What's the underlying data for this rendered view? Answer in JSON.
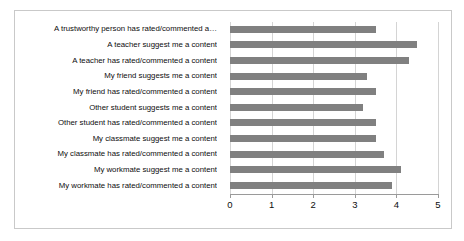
{
  "chart_data": {
    "type": "bar",
    "orientation": "horizontal",
    "title": "",
    "xlabel": "",
    "ylabel": "",
    "xlim": [
      0,
      5
    ],
    "xticks": [
      "0",
      "1",
      "2",
      "3",
      "4",
      "5"
    ],
    "grid": true,
    "legend": "none",
    "bar_color": "#808080",
    "categories": [
      "A trustworthy person has rated/commented a…",
      "A teacher suggest me a content",
      "A teacher has rated/commented a content",
      "My friend suggests me a content",
      "My friend has rated/commented a content",
      "Other student suggests me a content",
      "Other student has rated/commented a content",
      "My classmate suggest me a content",
      "My classmate has rated/commented a content",
      "My workmate suggest me a content",
      "My workmate has rated/commented a content"
    ],
    "values": [
      3.5,
      4.5,
      4.3,
      3.3,
      3.5,
      3.2,
      3.5,
      3.5,
      3.7,
      4.1,
      3.9
    ]
  }
}
